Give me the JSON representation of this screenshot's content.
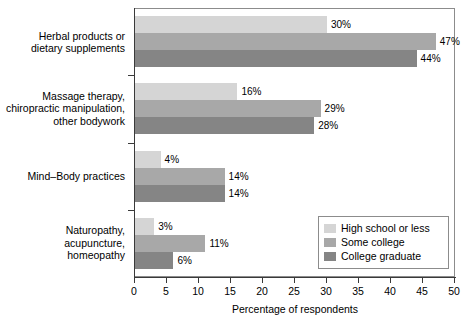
{
  "chart_data": {
    "type": "bar",
    "orientation": "horizontal",
    "title": "",
    "xlabel": "Percentage of respondents",
    "ylabel": "",
    "xlim": [
      0,
      50
    ],
    "xticks": [
      0,
      5,
      10,
      15,
      20,
      25,
      30,
      35,
      40,
      45,
      50
    ],
    "grid": false,
    "legend_position": "bottom-right",
    "value_suffix": "%",
    "categories": [
      "Herbal products or dietary supplements",
      "Massage therapy, chiropractic manipulation, other bodywork",
      "Mind–Body practices",
      "Naturopathy, acupuncture, homeopathy"
    ],
    "category_lines": [
      [
        "Herbal products or",
        "dietary supplements"
      ],
      [
        "Massage therapy,",
        "chiropractic manipulation,",
        "other bodywork"
      ],
      [
        "Mind–Body practices"
      ],
      [
        "Naturopathy,",
        "acupuncture,",
        "homeopathy"
      ]
    ],
    "series": [
      {
        "name": "High school or less",
        "color": "#d5d5d5",
        "values": [
          30,
          16,
          4,
          3
        ],
        "labels": [
          "30%",
          "16%",
          "4%",
          "3%"
        ]
      },
      {
        "name": "Some college",
        "color": "#a8a8a8",
        "values": [
          47,
          29,
          14,
          11
        ],
        "labels": [
          "47%",
          "29%",
          "14%",
          "11%"
        ]
      },
      {
        "name": "College graduate",
        "color": "#858585",
        "values": [
          44,
          28,
          14,
          6
        ],
        "labels": [
          "44%",
          "28%",
          "14%",
          "6%"
        ]
      }
    ]
  },
  "legend": {
    "items": [
      {
        "label": "High school or less"
      },
      {
        "label": "Some college"
      },
      {
        "label": "College graduate"
      }
    ]
  },
  "axis": {
    "x_title": "Percentage of respondents",
    "x_tick_labels": [
      "0",
      "5",
      "10",
      "15",
      "20",
      "25",
      "30",
      "35",
      "40",
      "45",
      "50"
    ]
  },
  "colors": {
    "series_light": "#d5d5d5",
    "series_medium": "#a8a8a8",
    "series_dark": "#858585",
    "axis": "#3a3a3a",
    "frame": "#8c8c8c",
    "background": "#ffffff"
  }
}
